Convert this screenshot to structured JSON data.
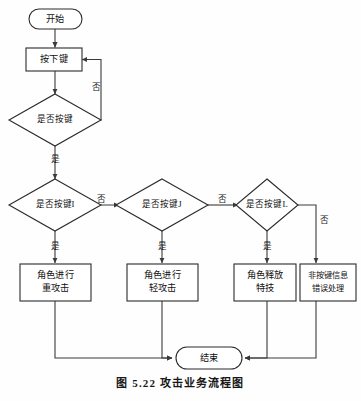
{
  "figure": {
    "caption": "图 5.22  攻击业务流程图",
    "title": "攻击业务流程图",
    "number": "图 5.22"
  },
  "nodes": {
    "start": {
      "label": "开始",
      "type": "terminator"
    },
    "press_key": {
      "label": "按下键",
      "type": "process"
    },
    "decide_any_key": {
      "label": "是否按键",
      "type": "decision"
    },
    "decide_key_i": {
      "label": "是否按键I",
      "type": "decision"
    },
    "decide_key_j": {
      "label": "是否按键J",
      "type": "decision"
    },
    "decide_key_l": {
      "label": "是否按键L",
      "type": "decision"
    },
    "heavy_attack": {
      "line1": "角色进行",
      "line2": "重攻击",
      "type": "process"
    },
    "light_attack": {
      "line1": "角色进行",
      "line2": "轻攻击",
      "type": "process"
    },
    "special_skill": {
      "line1": "角色释放",
      "line2": "特技",
      "type": "process"
    },
    "error_handle": {
      "line1": "非按键信息",
      "line2": "错误处理",
      "type": "process"
    },
    "end": {
      "label": "结束",
      "type": "terminator"
    }
  },
  "edges": {
    "any_key_no": "否",
    "any_key_yes": "是",
    "key_i_no": "否",
    "key_i_yes": "是",
    "key_j_no": "否",
    "key_j_yes": "是",
    "key_l_no": "否",
    "key_l_yes": "是"
  },
  "colors": {
    "stroke": "#2b2b2b",
    "connector": "#3a3a3a",
    "fill": "#ffffff",
    "text": "#111111",
    "background": "#fefefe"
  }
}
